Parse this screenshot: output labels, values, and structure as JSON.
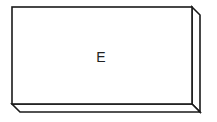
{
  "diagram": {
    "box_label": "E",
    "stroke_color": "#1a1a1a",
    "fill_color": "#ffffff"
  }
}
